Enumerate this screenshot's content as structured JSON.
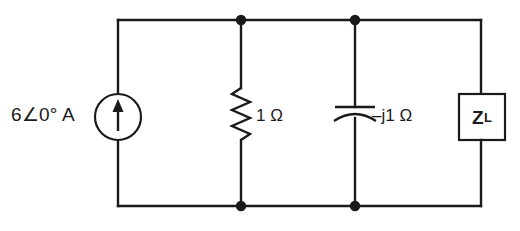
{
  "figure": {
    "kind": "ac-circuit-schematic",
    "width": 520,
    "height": 231,
    "line_color": "#1a1a1a",
    "background_color": "#ffffff"
  },
  "components": {
    "current_source": {
      "name": "independent-current-source",
      "symbol": "circle-with-up-arrow",
      "label": "6∠0° A",
      "magnitude": "6",
      "angle": "0°",
      "unit": "A",
      "arrow_direction": "up"
    },
    "resistor": {
      "name": "resistor",
      "symbol": "zigzag",
      "label": "1 Ω",
      "value": "1",
      "unit": "Ω"
    },
    "capacitor": {
      "name": "capacitor",
      "symbol": "curved-plate-capacitor",
      "label": "–j1 Ω",
      "value": "–j1",
      "unit": "Ω"
    },
    "load": {
      "name": "load-impedance",
      "symbol": "rectangle-box",
      "label_main": "Z",
      "label_sub": "L"
    }
  },
  "nodes": {
    "top_node_count": 2,
    "bottom_node_count": 2
  }
}
